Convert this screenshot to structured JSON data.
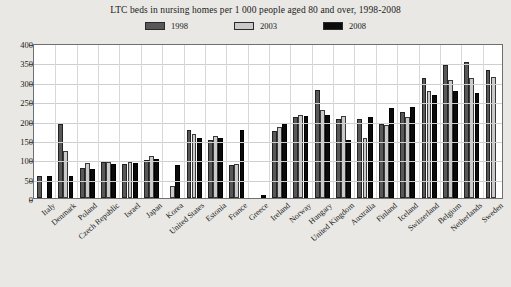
{
  "chart_data": {
    "type": "bar",
    "title": "LTC beds in nursing homes per 1 000 people aged 80 and over, 1998-2008",
    "xlabel": "",
    "ylabel": "",
    "ylim": [
      0,
      400
    ],
    "yticks": [
      0,
      50,
      100,
      150,
      200,
      250,
      300,
      350,
      400
    ],
    "grid": true,
    "legend_position": "top-center",
    "categories": [
      "Italy",
      "Denmark",
      "Poland",
      "Czech Republic",
      "Israel",
      "Japan",
      "Korea",
      "United States",
      "Estonia",
      "France",
      "Greece",
      "Ireland",
      "Norway",
      "Hungary",
      "United Kingdom",
      "Australia",
      "Finland",
      "Iceland",
      "Switzerland",
      "Belgium",
      "Netherlands",
      "Sweden"
    ],
    "series": [
      {
        "name": "1998",
        "color": "#585858",
        "values": [
          57,
          192,
          78,
          92,
          89,
          97,
          null,
          175,
          150,
          85,
          null,
          172,
          210,
          280,
          205,
          205,
          190,
          222,
          310,
          343,
          350,
          330
        ]
      },
      {
        "name": "2003",
        "color": "#cacaca",
        "values": [
          null,
          122,
          90,
          92,
          94,
          108,
          31,
          165,
          160,
          88,
          null,
          182,
          215,
          228,
          212,
          155,
          188,
          210,
          275,
          305,
          310,
          312
        ]
      },
      {
        "name": "2008",
        "color": "#0b0b0b",
        "values": [
          58,
          57,
          74,
          88,
          90,
          101,
          86,
          155,
          155,
          175,
          8,
          190,
          212,
          215,
          150,
          208,
          232,
          235,
          265,
          275,
          272,
          null
        ]
      }
    ]
  },
  "legend": {
    "items": [
      {
        "label": "1998"
      },
      {
        "label": "2003"
      },
      {
        "label": "2008"
      }
    ]
  }
}
